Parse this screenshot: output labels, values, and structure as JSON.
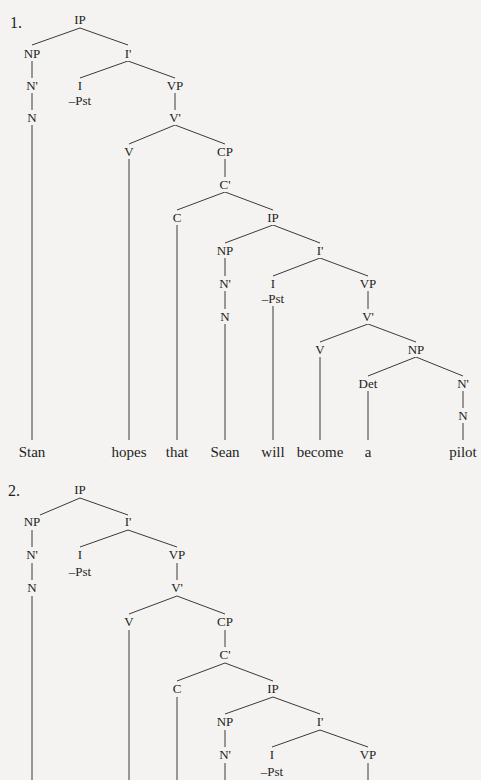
{
  "trees": [
    {
      "label": "1.",
      "label_pos": [
        10,
        28
      ],
      "nodes": [
        {
          "id": "IP",
          "text": "IP",
          "x": 80,
          "y": 24
        },
        {
          "id": "NP1",
          "text": "NP",
          "x": 32,
          "y": 58
        },
        {
          "id": "Ibar1",
          "text": "I'",
          "x": 128,
          "y": 58
        },
        {
          "id": "Nbar1",
          "text": "N'",
          "x": 32,
          "y": 90
        },
        {
          "id": "I1",
          "text": "I",
          "x": 80,
          "y": 90
        },
        {
          "id": "Pst1",
          "text": "–Pst",
          "x": 80,
          "y": 105
        },
        {
          "id": "VP1",
          "text": "VP",
          "x": 175,
          "y": 90
        },
        {
          "id": "N1",
          "text": "N",
          "x": 32,
          "y": 122
        },
        {
          "id": "Vbar1",
          "text": "V'",
          "x": 175,
          "y": 122
        },
        {
          "id": "V1",
          "text": "V",
          "x": 129,
          "y": 156
        },
        {
          "id": "CP",
          "text": "CP",
          "x": 225,
          "y": 156
        },
        {
          "id": "Cbar",
          "text": "C'",
          "x": 225,
          "y": 189
        },
        {
          "id": "C",
          "text": "C",
          "x": 177,
          "y": 222
        },
        {
          "id": "IP2",
          "text": "IP",
          "x": 273,
          "y": 222
        },
        {
          "id": "NP2",
          "text": "NP",
          "x": 225,
          "y": 255
        },
        {
          "id": "Ibar2",
          "text": "I'",
          "x": 320,
          "y": 255
        },
        {
          "id": "Nbar2",
          "text": "N'",
          "x": 225,
          "y": 288
        },
        {
          "id": "I2",
          "text": "I",
          "x": 273,
          "y": 288
        },
        {
          "id": "Pst2",
          "text": "–Pst",
          "x": 273,
          "y": 303
        },
        {
          "id": "VP2",
          "text": "VP",
          "x": 368,
          "y": 288
        },
        {
          "id": "N2",
          "text": "N",
          "x": 225,
          "y": 321
        },
        {
          "id": "Vbar2",
          "text": "V'",
          "x": 368,
          "y": 321
        },
        {
          "id": "V2",
          "text": "V",
          "x": 320,
          "y": 354
        },
        {
          "id": "NP3",
          "text": "NP",
          "x": 416,
          "y": 354
        },
        {
          "id": "Det",
          "text": "Det",
          "x": 368,
          "y": 388
        },
        {
          "id": "Nbar3",
          "text": "N'",
          "x": 463,
          "y": 388
        },
        {
          "id": "N3",
          "text": "N",
          "x": 463,
          "y": 420
        }
      ],
      "edges": [
        [
          80,
          28,
          32,
          45
        ],
        [
          80,
          28,
          128,
          45
        ],
        [
          32,
          61,
          32,
          78
        ],
        [
          32,
          93,
          32,
          110
        ],
        [
          128,
          61,
          80,
          78
        ],
        [
          128,
          61,
          175,
          78
        ],
        [
          175,
          93,
          175,
          110
        ],
        [
          175,
          125,
          129,
          144
        ],
        [
          175,
          125,
          225,
          144
        ],
        [
          225,
          159,
          225,
          177
        ],
        [
          225,
          192,
          177,
          210
        ],
        [
          225,
          192,
          273,
          210
        ],
        [
          273,
          225,
          225,
          243
        ],
        [
          273,
          225,
          320,
          243
        ],
        [
          225,
          258,
          225,
          276
        ],
        [
          225,
          291,
          225,
          309
        ],
        [
          320,
          258,
          273,
          276
        ],
        [
          320,
          258,
          368,
          276
        ],
        [
          368,
          291,
          368,
          309
        ],
        [
          368,
          324,
          320,
          342
        ],
        [
          368,
          324,
          416,
          342
        ],
        [
          416,
          357,
          368,
          376
        ],
        [
          416,
          357,
          463,
          376
        ],
        [
          463,
          391,
          463,
          408
        ],
        [
          32,
          125,
          32,
          440
        ],
        [
          129,
          159,
          129,
          440
        ],
        [
          177,
          225,
          177,
          440
        ],
        [
          225,
          324,
          225,
          440
        ],
        [
          273,
          306,
          273,
          440
        ],
        [
          320,
          357,
          320,
          440
        ],
        [
          368,
          391,
          368,
          440
        ],
        [
          463,
          423,
          463,
          440
        ]
      ],
      "words": [
        {
          "text": "Stan",
          "x": 32,
          "y": 457
        },
        {
          "text": "hopes",
          "x": 129,
          "y": 457
        },
        {
          "text": "that",
          "x": 177,
          "y": 457
        },
        {
          "text": "Sean",
          "x": 225,
          "y": 457
        },
        {
          "text": "will",
          "x": 273,
          "y": 457
        },
        {
          "text": "become",
          "x": 320,
          "y": 457
        },
        {
          "text": "a",
          "x": 368,
          "y": 457
        },
        {
          "text": "pilot",
          "x": 463,
          "y": 457
        }
      ]
    },
    {
      "label": "2.",
      "label_pos": [
        8,
        496
      ],
      "nodes": [
        {
          "id": "IP",
          "text": "IP",
          "x": 80,
          "y": 494
        },
        {
          "id": "NP1",
          "text": "NP",
          "x": 32,
          "y": 526
        },
        {
          "id": "Ibar1",
          "text": "I'",
          "x": 128,
          "y": 526
        },
        {
          "id": "Nbar1",
          "text": "N'",
          "x": 32,
          "y": 559
        },
        {
          "id": "I1",
          "text": "I",
          "x": 80,
          "y": 559
        },
        {
          "id": "Pst1",
          "text": "–Pst",
          "x": 80,
          "y": 576
        },
        {
          "id": "VP1",
          "text": "VP",
          "x": 177,
          "y": 559
        },
        {
          "id": "N1",
          "text": "N",
          "x": 32,
          "y": 592
        },
        {
          "id": "Vbar1",
          "text": "V'",
          "x": 177,
          "y": 592
        },
        {
          "id": "V1",
          "text": "V",
          "x": 129,
          "y": 626
        },
        {
          "id": "CP",
          "text": "CP",
          "x": 225,
          "y": 626
        },
        {
          "id": "Cbar",
          "text": "C'",
          "x": 225,
          "y": 659
        },
        {
          "id": "C",
          "text": "C",
          "x": 177,
          "y": 693
        },
        {
          "id": "IP2",
          "text": "IP",
          "x": 273,
          "y": 693
        },
        {
          "id": "NP2",
          "text": "NP",
          "x": 225,
          "y": 726
        },
        {
          "id": "Ibar2",
          "text": "I'",
          "x": 320,
          "y": 726
        },
        {
          "id": "Nbar2",
          "text": "N'",
          "x": 225,
          "y": 759
        },
        {
          "id": "I2",
          "text": "I",
          "x": 272,
          "y": 759
        },
        {
          "id": "Pst2",
          "text": "–Pst",
          "x": 272,
          "y": 776
        },
        {
          "id": "VP2",
          "text": "VP",
          "x": 368,
          "y": 759
        }
      ],
      "edges": [
        [
          80,
          498,
          40,
          515
        ],
        [
          80,
          498,
          128,
          515
        ],
        [
          32,
          530,
          32,
          547
        ],
        [
          32,
          563,
          32,
          580
        ],
        [
          128,
          530,
          80,
          547
        ],
        [
          128,
          530,
          177,
          547
        ],
        [
          177,
          563,
          177,
          580
        ],
        [
          177,
          596,
          129,
          614
        ],
        [
          177,
          596,
          225,
          614
        ],
        [
          225,
          630,
          225,
          647
        ],
        [
          225,
          663,
          177,
          681
        ],
        [
          225,
          663,
          273,
          681
        ],
        [
          273,
          697,
          225,
          714
        ],
        [
          273,
          697,
          320,
          714
        ],
        [
          225,
          730,
          225,
          747
        ],
        [
          225,
          763,
          225,
          780
        ],
        [
          320,
          730,
          272,
          747
        ],
        [
          320,
          730,
          368,
          747
        ],
        [
          368,
          763,
          368,
          780
        ],
        [
          32,
          596,
          32,
          780
        ],
        [
          129,
          630,
          129,
          780
        ],
        [
          177,
          697,
          177,
          780
        ]
      ],
      "words": []
    }
  ],
  "colors": {
    "background": "#f4f3f1",
    "ink": "#1e1e1e",
    "line": "#3a3a3a"
  }
}
